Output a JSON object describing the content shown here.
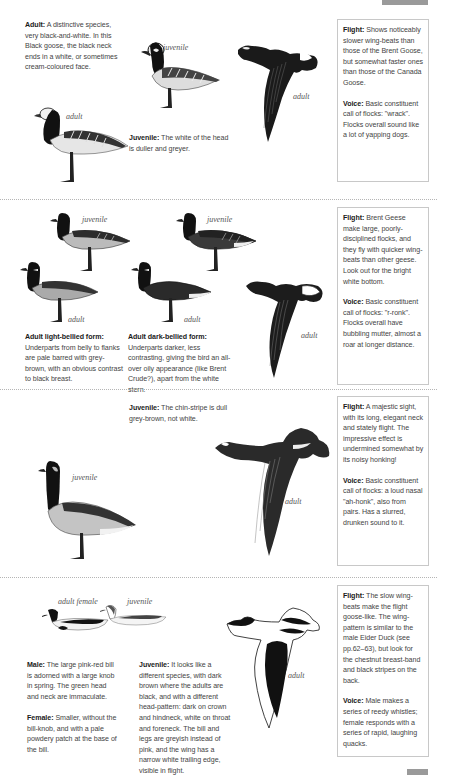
{
  "page_tabs": {
    "top_tab_color": "#9a9a9a",
    "bottom_tab_color": "#9a9a9a"
  },
  "sections": [
    {
      "id": "barnacle",
      "texts": {
        "adult_label": "Adult:",
        "adult_text": " A distinctive species, very black-and-white. In this Black goose, the black neck ends in a white, or sometimes cream-coloured face.",
        "juvenile_label": "Juvenile:",
        "juvenile_text": " The white of the head is duller and greyer."
      },
      "illustration_labels": {
        "standing_top": "juvenile",
        "standing_bottom": "adult",
        "flying": "adult"
      },
      "panel": {
        "flight_label": "Flight:",
        "flight_text": " Shows noticeably slower wing-beats than those of the Brent Goose, but somewhat faster ones than those of the Canada Goose.",
        "voice_label": "Voice:",
        "voice_text": " Basic constituent call of flocks: \"wrack\". Flocks overall sound like a lot of yapping dogs."
      }
    },
    {
      "id": "brent",
      "texts": {
        "light_label": "Adult light-bellied form:",
        "light_text": "Underparts from belly to flanks are pale barred with grey-brown, with an obvious contrast to black breast.",
        "dark_label": "Adult dark-bellied form:",
        "dark_text": "Underparts darker, less contrasting, giving the bird an all-over oily appearance (like Brent Crude?), apart from the white stern."
      },
      "illustration_labels": {
        "juv_left": "juvenile",
        "juv_right": "juvenile",
        "adult_left": "adult",
        "adult_mid": "adult",
        "flying": "adult"
      },
      "panel": {
        "flight_label": "Flight:",
        "flight_text": " Brent Geese make large, poorly-disciplined flocks, and they fly with quicker wing-beats than other geese. Look out for the bright white bottom.",
        "voice_label": "Voice:",
        "voice_text": " Basic constituent call of flocks: \"r-ronk\". Flocks overall have bubbling mutter, almost a roar at longer distance."
      }
    },
    {
      "id": "canada",
      "texts": {
        "juvenile_label": "Juvenile:",
        "juvenile_text": " The chin-stripe is dull grey-brown, not white."
      },
      "illustration_labels": {
        "standing": "juvenile",
        "flying": "adult"
      },
      "panel": {
        "flight_label": "Flight:",
        "flight_text": " A majestic sight, with its long, elegant neck and stately flight. The impressive effect is undermined somewhat by its noisy honking!",
        "voice_label": "Voice:",
        "voice_text": " Basic constituent call of flocks: a loud nasal \"ah-honk\", also from pairs. Has a slurred, drunken sound to it."
      }
    },
    {
      "id": "shelduck",
      "texts": {
        "male_label": "Male:",
        "male_text": " The large pink-red bill is adorned with a large knob in spring. The green head and neck are immaculate.",
        "female_label": "Female:",
        "female_text": " Smaller, without the bill-knob, and with a pale powdery patch at the base of the bill.",
        "juvenile_label": "Juvenile:",
        "juvenile_text": " It looks like a different species, with dark brown where the adults are black, and with a different head-pattern: dark on crown and hindneck, white on throat and foreneck. The bill and legs are greyish instead of pink, and the wing has a narrow white trailing edge, visible in flight."
      },
      "illustration_labels": {
        "swimming_left": "adult female",
        "swimming_right": "juvenile",
        "flying": "adult"
      },
      "panel": {
        "flight_label": "Flight:",
        "flight_text": " The slow wing-beats make the flight goose-like. The wing-pattern is similar to the male Eider Duck (see pp.62–63), but look for the chestnut breast-band and black stripes on the back.",
        "voice_label": "Voice:",
        "voice_text": " Male makes a series of reedy whistles; female responds with a series of rapid, laughing quacks."
      }
    }
  ]
}
